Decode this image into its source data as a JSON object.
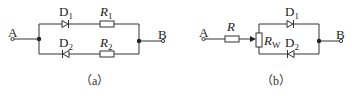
{
  "figure_a": {
    "caption": "（a）",
    "terminal_a": "A",
    "terminal_b": "B",
    "d1": {
      "name": "D",
      "sub": "1"
    },
    "d2": {
      "name": "D",
      "sub": "2"
    },
    "r1": {
      "name": "R",
      "sub": "1"
    },
    "r2": {
      "name": "R",
      "sub": "2"
    }
  },
  "figure_b": {
    "caption": "（b）",
    "terminal_a": "A",
    "terminal_b": "B",
    "r": {
      "name": "R"
    },
    "rw": {
      "name": "R",
      "sub": "W"
    },
    "d1": {
      "name": "D",
      "sub": "1"
    },
    "d2": {
      "name": "D",
      "sub": "2"
    }
  },
  "colors": {
    "line": "#333333",
    "background": "#ffffff"
  }
}
